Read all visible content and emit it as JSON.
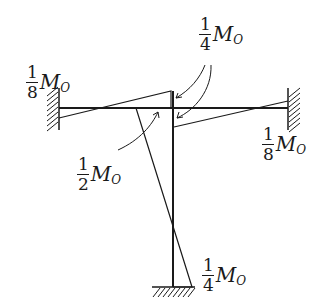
{
  "diagram": {
    "labels": {
      "left_end": {
        "num": "1",
        "den": "8",
        "symbol": "M",
        "sub": "O"
      },
      "top_joint": {
        "num": "1",
        "den": "4",
        "symbol": "M",
        "sub": "O"
      },
      "mid_joint": {
        "num": "1",
        "den": "2",
        "symbol": "M",
        "sub": "O"
      },
      "right_end": {
        "num": "1",
        "den": "8",
        "symbol": "M",
        "sub": "O"
      },
      "base": {
        "num": "1",
        "den": "4",
        "symbol": "M",
        "sub": "O"
      }
    },
    "colors": {
      "stroke": "#1a1a1a",
      "background": "#ffffff"
    }
  }
}
